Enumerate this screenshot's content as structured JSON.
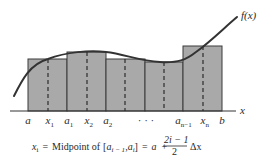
{
  "figure": {
    "function_label": "f(x)",
    "axis_label": "x",
    "colors": {
      "rect_fill": "#a9a9a9",
      "rect_stroke": "#3a3a3a",
      "curve": "#333333",
      "axis": "#333333",
      "dashed": "#222222",
      "text": "#2a2a2a"
    },
    "rectangles": [
      {
        "x_left": 28,
        "x_right": 67,
        "top": 59,
        "midpoint_x": 48
      },
      {
        "x_left": 67,
        "x_right": 106,
        "top": 52,
        "midpoint_x": 87
      },
      {
        "x_left": 106,
        "x_right": 145,
        "top": 59,
        "midpoint_x": 125
      },
      {
        "x_left": 145,
        "x_right": 183,
        "top": 62,
        "midpoint_x": 164
      },
      {
        "x_left": 183,
        "x_right": 222,
        "top": 46,
        "midpoint_x": 203
      }
    ],
    "axis_y": 111,
    "tick_labels": [
      {
        "main": "a",
        "sub": "",
        "x": 28
      },
      {
        "main": "x",
        "sub": "1",
        "x": 48
      },
      {
        "main": "a",
        "sub": "1",
        "x": 67
      },
      {
        "main": "x",
        "sub": "2",
        "x": 87
      },
      {
        "main": "a",
        "sub": "2",
        "x": 106
      },
      {
        "main": "· · ·",
        "sub": "",
        "x": 146
      },
      {
        "main": "a",
        "sub": "n−1",
        "x": 178
      },
      {
        "main": "x",
        "sub": "n",
        "x": 203
      },
      {
        "main": "b",
        "sub": "",
        "x": 222
      }
    ],
    "formula": {
      "lhs_var": "x",
      "lhs_sub": "i",
      "equals1": "=",
      "text": "Midpoint of",
      "interval_open": "[",
      "interval_a1": "a",
      "interval_a1_sub": "i − 1",
      "interval_comma": ",",
      "interval_a2": "a",
      "interval_a2_sub": "i",
      "interval_close": "]",
      "equals2": "=",
      "rhs_a": "a",
      "plus": "+",
      "frac_num": "2i − 1",
      "frac_den": "2",
      "delta_x": "Δx"
    }
  }
}
